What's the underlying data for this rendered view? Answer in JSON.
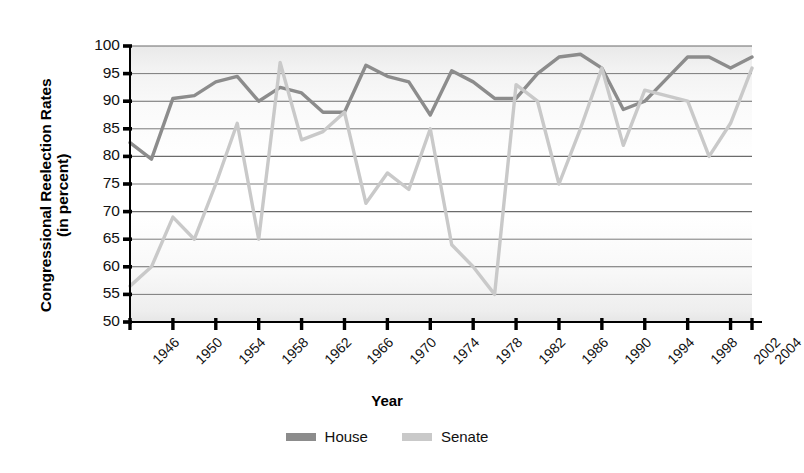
{
  "chart_data": {
    "type": "line",
    "title": "",
    "xlabel": "Year",
    "ylabel_line1": "Congressional Reelection Rates",
    "ylabel_line2": "(in percent)",
    "ylim": [
      50,
      100
    ],
    "yticks": [
      50,
      55,
      60,
      65,
      70,
      75,
      80,
      85,
      90,
      95,
      100
    ],
    "xlim": [
      1946,
      2004
    ],
    "xticks": [
      1946,
      1950,
      1954,
      1958,
      1962,
      1966,
      1970,
      1974,
      1978,
      1982,
      1986,
      1990,
      1994,
      1998,
      2002,
      2004
    ],
    "xtick_labels": [
      "1946",
      "1950",
      "1954",
      "1958",
      "1962",
      "1966",
      "1970",
      "1974",
      "1978",
      "1982",
      "1986",
      "1990",
      "1994",
      "1998",
      "2002",
      "2004"
    ],
    "x": [
      1946,
      1948,
      1950,
      1952,
      1954,
      1956,
      1958,
      1960,
      1962,
      1964,
      1966,
      1968,
      1970,
      1972,
      1974,
      1976,
      1978,
      1980,
      1982,
      1984,
      1986,
      1988,
      1990,
      1992,
      1994,
      1996,
      1998,
      2000,
      2002,
      2004
    ],
    "grid": true,
    "legend_position": "bottom",
    "series": [
      {
        "name": "House",
        "color": "#8c8c8c",
        "values": [
          82.5,
          79.5,
          90.5,
          91,
          93.5,
          94.5,
          90,
          92.5,
          91.5,
          88,
          88,
          96.5,
          94.5,
          93.5,
          87.5,
          95.5,
          93.5,
          90.5,
          90.5,
          95,
          98,
          98.5,
          96,
          88.5,
          90,
          94,
          98,
          98,
          96,
          98
        ]
      },
      {
        "name": "Senate",
        "color": "#c9c9c9",
        "values": [
          56.5,
          60,
          69,
          65,
          75,
          86,
          65,
          97,
          83,
          84.5,
          88,
          71.5,
          77,
          74,
          85,
          64,
          60,
          55,
          93,
          90,
          75,
          85,
          96,
          82,
          92,
          91,
          90,
          80,
          86,
          96
        ]
      }
    ]
  },
  "legend": {
    "items": [
      {
        "label": "House",
        "color": "#8c8c8c"
      },
      {
        "label": "Senate",
        "color": "#c9c9c9"
      }
    ]
  }
}
